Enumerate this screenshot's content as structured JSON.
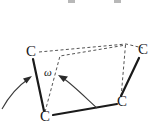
{
  "figure": {
    "name": "torsion-angle-diagram",
    "width": 157,
    "height": 133,
    "background_color": "#ffffff"
  },
  "colors": {
    "bond_solid": "#1a1a1a",
    "plane_dashed": "#555555",
    "arrow": "#3a3a3a",
    "label_text": "#1a1a1a",
    "clip_artifact": "#b8b8b8"
  },
  "atoms": [
    {
      "id": "c-top-left",
      "label": "C",
      "x": 31,
      "y": 53
    },
    {
      "id": "c-bottom-left",
      "label": "C",
      "x": 45,
      "y": 118
    },
    {
      "id": "c-bottom-right",
      "label": "C",
      "x": 122,
      "y": 103
    },
    {
      "id": "c-top-right",
      "label": "C",
      "x": 143,
      "y": 51
    }
  ],
  "bonds": [
    {
      "id": "bond-c1-c2",
      "from": "c-top-left",
      "to": "c-bottom-left",
      "style": "solid",
      "x1": 33,
      "y1": 59,
      "x2": 44,
      "y2": 111
    },
    {
      "id": "bond-c2-c3",
      "from": "c-bottom-left",
      "to": "c-bottom-right",
      "style": "solid",
      "x1": 53,
      "y1": 115,
      "x2": 117,
      "y2": 104
    },
    {
      "id": "bond-c3-c4",
      "from": "c-bottom-right",
      "to": "c-top-right",
      "style": "solid",
      "x1": 121,
      "y1": 96,
      "x2": 139,
      "y2": 58
    }
  ],
  "planes": [
    {
      "id": "plane-rear",
      "style": "dashed",
      "points": [
        [
          39,
          52
        ],
        [
          126,
          44
        ],
        [
          143,
          48
        ]
      ]
    },
    {
      "id": "plane-front",
      "style": "dashed",
      "points": [
        [
          45,
          112
        ],
        [
          60,
          56
        ],
        [
          126,
          45
        ],
        [
          125,
          48
        ],
        [
          121,
          98
        ]
      ]
    },
    {
      "id": "plane-vertical-right",
      "style": "dashed",
      "points": [
        [
          126,
          44
        ],
        [
          121,
          98
        ]
      ]
    }
  ],
  "angle": {
    "id": "omega-angle",
    "symbol": "ω",
    "x": 48,
    "y": 73,
    "meaning": "torsion angle omega"
  },
  "arrows": [
    {
      "id": "arrow-left",
      "path": "M 2,109 C 8,98 18,86 30,78",
      "head_at": [
        31,
        77
      ],
      "head_angle_deg": -34
    },
    {
      "id": "arrow-right",
      "path": "M 96,107 C 86,98 72,84 61,77",
      "head_at": [
        59,
        76
      ],
      "head_angle_deg": 213
    }
  ],
  "clip_artifacts": [
    {
      "id": "artifact-left",
      "x": 68,
      "y": 0,
      "width": 7,
      "height": 3
    },
    {
      "id": "artifact-right",
      "x": 114,
      "y": 0,
      "width": 7,
      "height": 3
    }
  ]
}
